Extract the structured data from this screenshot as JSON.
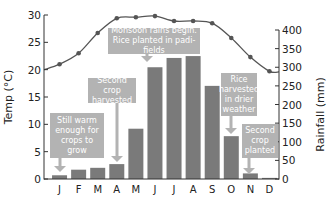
{
  "chart_data": {
    "type": "bar+line",
    "title": "",
    "categories": [
      "J",
      "F",
      "M",
      "A",
      "M",
      "J",
      "J",
      "A",
      "S",
      "O",
      "N",
      "D"
    ],
    "series": [
      {
        "name": "Rainfall (mm)",
        "type": "bar",
        "axis": "right",
        "values": [
          10,
          25,
          30,
          40,
          135,
          300,
          325,
          330,
          250,
          115,
          15,
          3
        ]
      },
      {
        "name": "Temp (°C)",
        "type": "line",
        "axis": "left",
        "values": [
          21,
          23,
          26.7,
          29.4,
          29.6,
          29.8,
          28.9,
          28.9,
          28.5,
          25.8,
          22.3,
          19.7
        ]
      }
    ],
    "ylabel_left": "Temp (°C)",
    "ylabel_right": "Rainfall (mm)",
    "ylim_left": [
      0,
      30
    ],
    "ylim_right": [
      0,
      400
    ],
    "yticks_left": [
      0,
      5,
      10,
      15,
      20,
      25,
      30
    ],
    "yticks_right": [
      0,
      50,
      100,
      150,
      200,
      250,
      300,
      350,
      400
    ],
    "grid": false,
    "annotations": [
      {
        "id": "still-warm",
        "text": "Still warm enough for crops to grow",
        "month": "J"
      },
      {
        "id": "second-crop-harvested",
        "text": "Second crop harvested",
        "month": "A"
      },
      {
        "id": "monsoon",
        "text": "Monsoon rains begin. Rice planted in padi-fields",
        "month": "J"
      },
      {
        "id": "rice-harvested",
        "text": "Rice harvested in drier weather",
        "month": "O"
      },
      {
        "id": "second-crop-planted",
        "text": "Second crop planted",
        "month": "N"
      }
    ]
  },
  "colors": {
    "bar": "#7a7a7a",
    "line": "#555555",
    "note_bg": "#b3b3b3",
    "note_text": "#ffffff",
    "axis": "#333333"
  },
  "labels": {
    "temp_axis": "Temp (°C)",
    "rain_axis": "Rainfall (mm)"
  },
  "notes": {
    "still_warm": "Still warm enough for crops to grow",
    "second_crop_harvested": "Second crop harvested",
    "monsoon": "Monsoon rains begin. Rice planted in padi-fields",
    "rice_harvested": "Rice harvested in drier weather",
    "second_crop_planted": "Second crop planted"
  }
}
